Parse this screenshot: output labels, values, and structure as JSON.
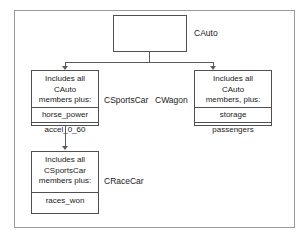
{
  "diagram": {
    "type": "uml-class-inheritance",
    "background_color": "#ffffff",
    "border_color": "#9a9a9a",
    "box_border_color": "#4f4f4f",
    "text_color": "#1a1a1a",
    "connector_color": "#5a5a5a"
  },
  "classes": {
    "cauto": {
      "name": "CAuto",
      "header": "",
      "members": []
    },
    "csportscar": {
      "name": "CSportsCar",
      "header": "Includes all\nCAuto\nmembers plus:",
      "members": [
        "horse_power",
        "accel_0_60"
      ]
    },
    "cwagon": {
      "name": "CWagon",
      "header": "Includes all\nCAuto\nmembers, plus:",
      "members": [
        "storage",
        "passengers"
      ]
    },
    "cracecar": {
      "name": "CRaceCar",
      "header": "Includes all\nCSportsCar\nmembers plus:",
      "members": [
        "races_won"
      ]
    }
  },
  "relationships": [
    {
      "from": "CAuto",
      "to": "CSportsCar",
      "kind": "inheritance"
    },
    {
      "from": "CAuto",
      "to": "CWagon",
      "kind": "inheritance"
    },
    {
      "from": "CSportsCar",
      "to": "CRaceCar",
      "kind": "inheritance"
    }
  ]
}
